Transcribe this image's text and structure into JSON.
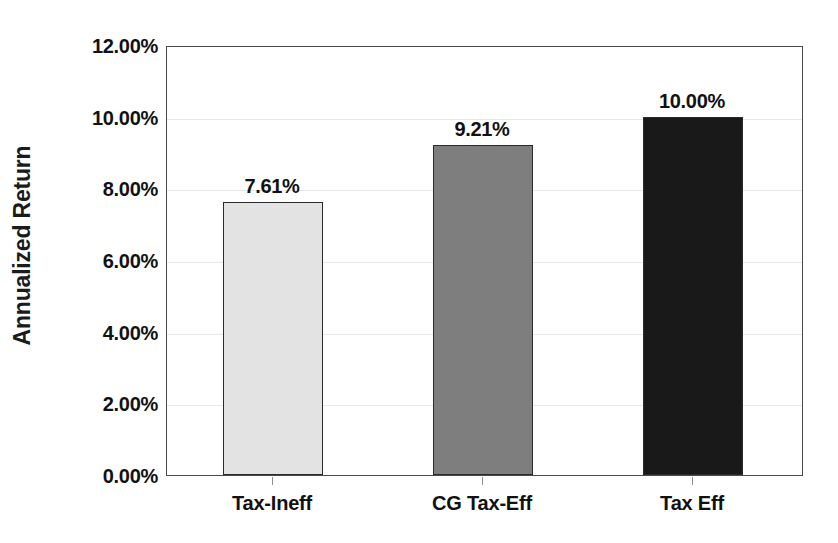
{
  "chart_data": {
    "type": "bar",
    "title": "",
    "xlabel": "",
    "ylabel": "Annualized Return",
    "categories": [
      "Tax-Ineff",
      "CG Tax-Eff",
      "Tax Eff"
    ],
    "values": [
      7.61,
      9.21,
      10.0
    ],
    "data_labels": [
      "7.61%",
      "9.21%",
      "10.00%"
    ],
    "series": [
      {
        "name": "Annualized Return",
        "values": [
          7.61,
          9.21,
          10.0
        ]
      }
    ],
    "ylim": [
      0,
      12
    ],
    "ytick_values": [
      0,
      2,
      4,
      6,
      8,
      10,
      12
    ],
    "ytick_labels": [
      "0.00%",
      "2.00%",
      "4.00%",
      "6.00%",
      "8.00%",
      "10.00%",
      "12.00%"
    ],
    "grid": true,
    "legend": "none",
    "bar_colors": [
      "#e3e3e3",
      "#7e7e7e",
      "#191919"
    ],
    "bar_border_color": "#2b2b2b",
    "plot_border_color": "#4a4a4a",
    "gridline_color": "#e8e8e8",
    "background_color": "#ffffff",
    "text_color": "#111111"
  }
}
